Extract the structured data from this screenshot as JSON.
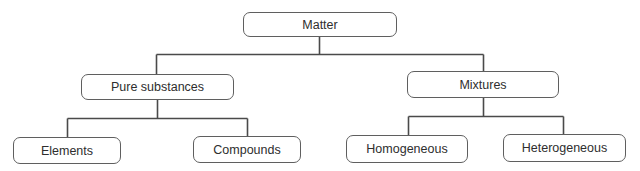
{
  "diagram": {
    "type": "tree",
    "line_color": "#4a4a4a",
    "border_color": "#5f5f5f",
    "text_color": "#2e2e2e",
    "nodes": {
      "root": {
        "label": "Matter"
      },
      "pure": {
        "label": "Pure substances"
      },
      "mixtures": {
        "label": "Mixtures"
      },
      "elements": {
        "label": "Elements"
      },
      "compounds": {
        "label": "Compounds"
      },
      "homogeneous": {
        "label": "Homogeneous"
      },
      "heterogeneous": {
        "label": "Heterogeneous"
      }
    },
    "edges": [
      {
        "from": "Matter",
        "to": "Pure substances"
      },
      {
        "from": "Matter",
        "to": "Mixtures"
      },
      {
        "from": "Pure substances",
        "to": "Elements"
      },
      {
        "from": "Pure substances",
        "to": "Compounds"
      },
      {
        "from": "Mixtures",
        "to": "Homogeneous"
      },
      {
        "from": "Mixtures",
        "to": "Heterogeneous"
      }
    ]
  }
}
